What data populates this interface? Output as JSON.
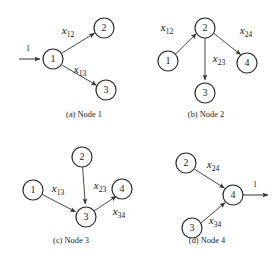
{
  "figure": {
    "background_color": "#ffffff",
    "node_stroke_color": "#2b2b2b",
    "edge_color": "#4a4a4a",
    "text_color": "#1c1c1c",
    "width": 280,
    "height": 259
  },
  "panels": [
    {
      "id": "a",
      "caption": "(a)  Node 1",
      "caption_x": 84,
      "caption_y": 117,
      "nodes": [
        {
          "label": "1",
          "cx": 53,
          "cy": 59,
          "r": 10
        },
        {
          "label": "2",
          "cx": 104,
          "cy": 28,
          "r": 10
        },
        {
          "label": "3",
          "cx": 106,
          "cy": 90,
          "r": 10
        }
      ],
      "edges": [
        {
          "from": "1",
          "to": "2",
          "label": "x",
          "sub": "12",
          "label_x": 68,
          "label_y": 34
        },
        {
          "from": "1",
          "to": "3",
          "label": "x",
          "sub": "13",
          "label_x": 80,
          "label_y": 73
        }
      ],
      "external_flows": [
        {
          "label": "1",
          "direction": "in",
          "x1": 19,
          "y1": 59,
          "x2": 41,
          "y2": 59,
          "label_x": 28,
          "label_y": 50
        }
      ]
    },
    {
      "id": "b",
      "caption": "(b)  Node 2",
      "caption_x": 206,
      "caption_y": 117,
      "nodes": [
        {
          "label": "2",
          "cx": 205,
          "cy": 28,
          "r": 10
        },
        {
          "label": "1",
          "cx": 168,
          "cy": 61,
          "r": 10
        },
        {
          "label": "4",
          "cx": 247,
          "cy": 63,
          "r": 10
        },
        {
          "label": "3",
          "cx": 205,
          "cy": 93,
          "r": 10
        }
      ],
      "edges": [
        {
          "from": "1",
          "to": "2",
          "label": "x",
          "sub": "12",
          "label_x": 167,
          "label_y": 31
        },
        {
          "from": "2",
          "to": "4",
          "label": "x",
          "sub": "24",
          "label_x": 245,
          "label_y": 34
        },
        {
          "from": "2",
          "to": "3",
          "label": "x",
          "sub": "23",
          "label_x": 218,
          "label_y": 62
        }
      ],
      "external_flows": []
    },
    {
      "id": "c",
      "caption": "(c)  Node 3",
      "caption_x": 71,
      "caption_y": 243,
      "nodes": [
        {
          "label": "2",
          "cx": 82,
          "cy": 157,
          "r": 10
        },
        {
          "label": "1",
          "cx": 33,
          "cy": 190,
          "r": 10
        },
        {
          "label": "4",
          "cx": 122,
          "cy": 189,
          "r": 10
        },
        {
          "label": "3",
          "cx": 86,
          "cy": 217,
          "r": 10
        }
      ],
      "edges": [
        {
          "from": "2",
          "to": "3",
          "label": "x",
          "sub": "23",
          "label_x": 99,
          "label_y": 189
        },
        {
          "from": "1",
          "to": "3",
          "label": "x",
          "sub": "13",
          "label_x": 57,
          "label_y": 192
        },
        {
          "from": "3",
          "to": "4",
          "label": "x",
          "sub": "34",
          "label_x": 118,
          "label_y": 215
        }
      ],
      "external_flows": []
    },
    {
      "id": "d",
      "caption": "(d)  Node 4",
      "caption_x": 207,
      "caption_y": 243,
      "nodes": [
        {
          "label": "2",
          "cx": 186,
          "cy": 163,
          "r": 10
        },
        {
          "label": "4",
          "cx": 233,
          "cy": 195,
          "r": 10
        },
        {
          "label": "3",
          "cx": 192,
          "cy": 228,
          "r": 10
        }
      ],
      "edges": [
        {
          "from": "2",
          "to": "4",
          "label": "x",
          "sub": "24",
          "label_x": 212,
          "label_y": 168
        },
        {
          "from": "3",
          "to": "4",
          "label": "x",
          "sub": "34",
          "label_x": 214,
          "label_y": 224
        }
      ],
      "external_flows": [
        {
          "label": "1",
          "direction": "out",
          "x1": 245,
          "y1": 195,
          "x2": 270,
          "y2": 195,
          "label_x": 256,
          "label_y": 186
        }
      ]
    }
  ]
}
